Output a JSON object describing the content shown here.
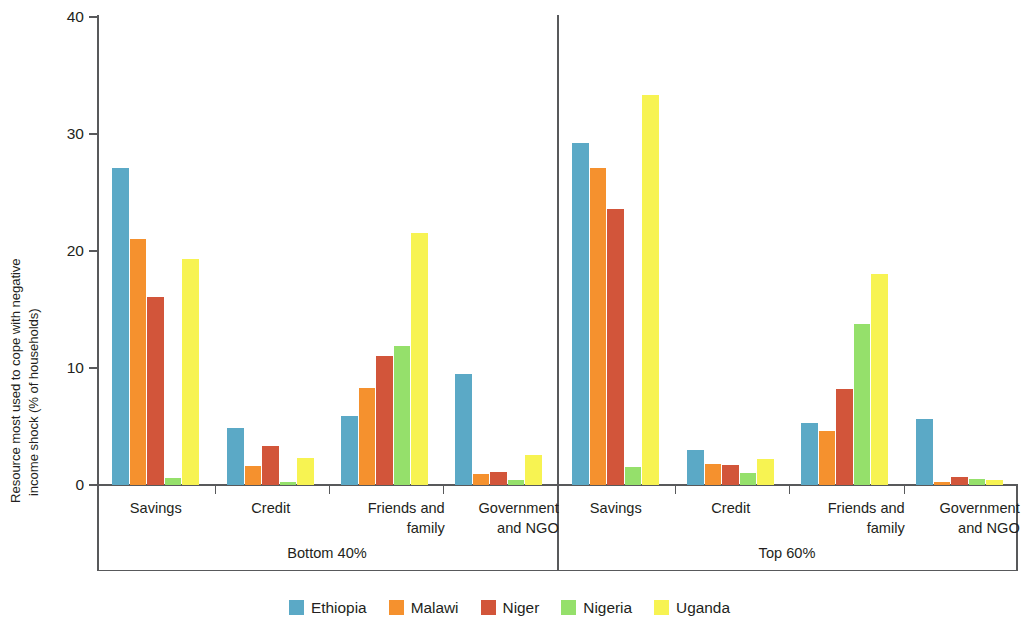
{
  "chart_data": {
    "type": "bar",
    "title": "",
    "xlabel": "",
    "ylabel_line1": "Resource most used to cope with negative",
    "ylabel_line2": "income shock (% of households)",
    "ylim": [
      0,
      40
    ],
    "yticks": [
      0,
      10,
      20,
      30,
      40
    ],
    "ytick_labels": [
      "0",
      "10",
      "20",
      "30",
      "40"
    ],
    "grid": false,
    "legend_position": "bottom",
    "panels": [
      "Bottom 40%",
      "Top 60%"
    ],
    "categories": [
      "Savings",
      "Credit",
      "Friends and family",
      "Government and NGO"
    ],
    "series": [
      {
        "name": "Ethiopia",
        "color": "#5BA9C6",
        "values_bottom40": [
          27.1,
          4.9,
          5.9,
          9.5
        ],
        "values_top60": [
          29.2,
          3.0,
          5.3,
          5.6
        ]
      },
      {
        "name": "Malawi",
        "color": "#F5912E",
        "values_bottom40": [
          21.0,
          1.6,
          8.3,
          0.9
        ],
        "values_top60": [
          27.1,
          1.8,
          4.6,
          0.3
        ]
      },
      {
        "name": "Niger",
        "color": "#D2553A",
        "values_bottom40": [
          16.1,
          3.3,
          11.0,
          1.1
        ],
        "values_top60": [
          23.6,
          1.7,
          8.2,
          0.7
        ]
      },
      {
        "name": "Nigeria",
        "color": "#95E06B",
        "values_bottom40": [
          0.6,
          0.3,
          11.9,
          0.4
        ],
        "values_top60": [
          1.5,
          1.0,
          13.8,
          0.5
        ]
      },
      {
        "name": "Uganda",
        "color": "#F7F352",
        "values_bottom40": [
          19.3,
          2.3,
          21.5,
          2.6
        ],
        "values_top60": [
          33.3,
          2.2,
          18.0,
          0.4
        ]
      }
    ]
  },
  "axis": {
    "y_title_line1": "Resource most used to cope with negative",
    "y_title_line2": "income shock (% of households)",
    "ytick_labels": [
      "40",
      "30",
      "20",
      "10",
      "0"
    ]
  },
  "categories": {
    "savings": "Savings",
    "credit": "Credit",
    "friends_l1": "Friends and",
    "friends_l2": "family",
    "gov_l1": "Government",
    "gov_l2": "and NGO"
  },
  "panels": {
    "bottom": "Bottom 40%",
    "top": "Top 60%"
  },
  "legend": {
    "items": [
      {
        "label": "Ethiopia",
        "color": "#5BA9C6"
      },
      {
        "label": "Malawi",
        "color": "#F5912E"
      },
      {
        "label": "Niger",
        "color": "#D2553A"
      },
      {
        "label": "Nigeria",
        "color": "#95E06B"
      },
      {
        "label": "Uganda",
        "color": "#F7F352"
      }
    ]
  }
}
